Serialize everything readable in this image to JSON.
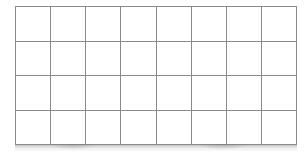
{
  "canvas": {
    "width": 308,
    "height": 154,
    "background_color": "#ffffff"
  },
  "grid": {
    "name": "empty-grid-table",
    "columns": 8,
    "rows": 4,
    "line_color": "#8a8a8a",
    "line_width_px": 1,
    "cell_fill": "#ffffff",
    "bounds": {
      "left": 15,
      "top": 6,
      "width": 282,
      "height": 139
    },
    "column_headers": [
      "",
      "",
      "",
      "",
      "",
      "",
      "",
      ""
    ],
    "cells": [
      [
        "",
        "",
        "",
        "",
        "",
        "",
        "",
        ""
      ],
      [
        "",
        "",
        "",
        "",
        "",
        "",
        "",
        ""
      ],
      [
        "",
        "",
        "",
        "",
        "",
        "",
        "",
        ""
      ],
      [
        "",
        "",
        "",
        "",
        "",
        "",
        "",
        ""
      ]
    ]
  },
  "effects": {
    "bottom_shadow": true,
    "bottom_shadow_color": "#787878"
  }
}
